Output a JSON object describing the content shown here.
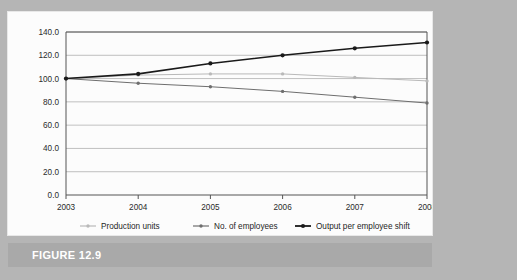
{
  "figure": {
    "caption": "FIGURE 12.9"
  },
  "chart_data": {
    "type": "line",
    "title": "",
    "xlabel": "",
    "ylabel": "",
    "categories": [
      "2003",
      "2004",
      "2005",
      "2006",
      "2007",
      "2008"
    ],
    "x": [
      2003,
      2004,
      2005,
      2006,
      2007,
      2008
    ],
    "ylim": [
      0.0,
      140.0
    ],
    "ytick_labels": [
      "0.0",
      "20.0",
      "40.0",
      "60.0",
      "80.0",
      "100.0",
      "120.0",
      "140.0"
    ],
    "yticks": [
      0.0,
      20.0,
      40.0,
      60.0,
      80.0,
      100.0,
      120.0,
      140.0
    ],
    "grid": true,
    "legend_position": "bottom",
    "series": [
      {
        "name": "Production units",
        "color": "#b9b9b9",
        "marker": "circle",
        "values": [
          100.0,
          103.0,
          104.0,
          104.0,
          101.0,
          98.0
        ]
      },
      {
        "name": "No. of employees",
        "color": "#6e6e6e",
        "marker": "circle",
        "values": [
          100.0,
          96.0,
          93.0,
          89.0,
          84.0,
          79.0
        ]
      },
      {
        "name": "Output per employee shift",
        "color": "#1a1a1a",
        "marker": "circle",
        "values": [
          100.0,
          104.0,
          113.0,
          120.0,
          126.0,
          131.0
        ]
      }
    ]
  },
  "colors": {
    "page_background": "#b5b5b5",
    "card_background": "#fcfcfc",
    "caption_bar": "#a9a9a9",
    "caption_text": "#ffffff",
    "axis": "#555555",
    "gridline": "#b0b0b0"
  }
}
